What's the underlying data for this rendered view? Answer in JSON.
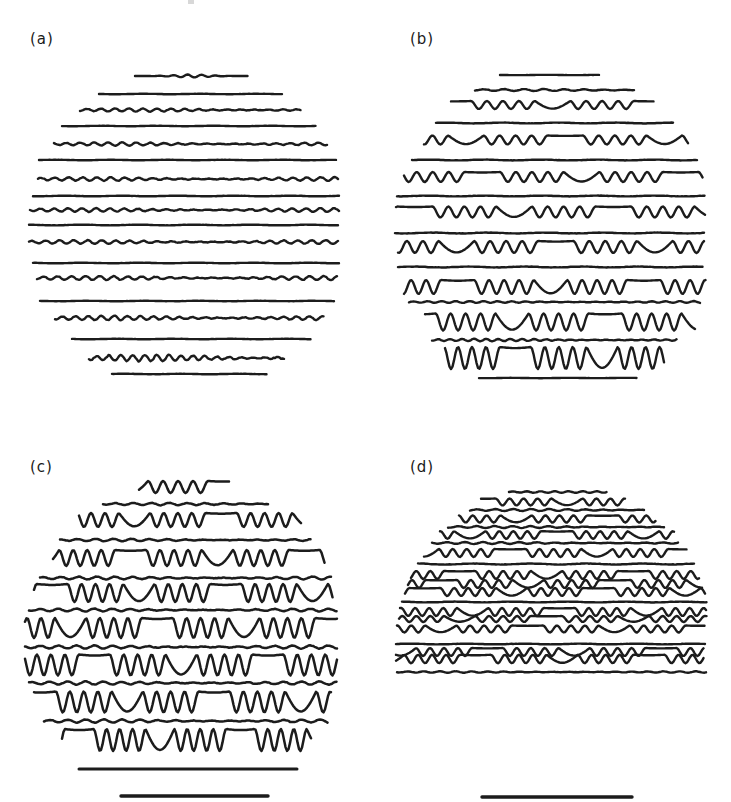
{
  "figure": {
    "ink_color": "#1c1c1c",
    "background": "#ffffff",
    "panels": [
      {
        "id": "a",
        "label": "(a)",
        "label_pos": [
          30,
          30
        ],
        "stroke": 2.4,
        "lines": [
          {
            "y": 76,
            "x1": 135,
            "x2": 248,
            "amp": 1.5,
            "period": 14,
            "pattern": "mid-wave"
          },
          {
            "y": 94,
            "x1": 99,
            "x2": 283,
            "amp": 0.3,
            "period": 20,
            "pattern": "flat"
          },
          {
            "y": 110,
            "x1": 80,
            "x2": 301,
            "amp": 1.6,
            "period": 14,
            "pattern": "wavy"
          },
          {
            "y": 126,
            "x1": 62,
            "x2": 316,
            "amp": 0.3,
            "period": 20,
            "pattern": "flat"
          },
          {
            "y": 144,
            "x1": 54,
            "x2": 328,
            "amp": 1.6,
            "period": 14,
            "pattern": "wavy"
          },
          {
            "y": 160,
            "x1": 39,
            "x2": 336,
            "amp": 0.3,
            "period": 20,
            "pattern": "flat"
          },
          {
            "y": 179,
            "x1": 38,
            "x2": 339,
            "amp": 1.8,
            "period": 14,
            "pattern": "wavy"
          },
          {
            "y": 196,
            "x1": 33,
            "x2": 339,
            "amp": 0.4,
            "period": 20,
            "pattern": "flat"
          },
          {
            "y": 210,
            "x1": 30,
            "x2": 339,
            "amp": 1.8,
            "period": 14,
            "pattern": "wavy"
          },
          {
            "y": 225,
            "x1": 29,
            "x2": 339,
            "amp": 0.5,
            "period": 20,
            "pattern": "flat"
          },
          {
            "y": 242,
            "x1": 29,
            "x2": 339,
            "amp": 1.8,
            "period": 14,
            "pattern": "wavy"
          },
          {
            "y": 263,
            "x1": 33,
            "x2": 339,
            "amp": 0.4,
            "period": 20,
            "pattern": "flat"
          },
          {
            "y": 278,
            "x1": 37,
            "x2": 338,
            "amp": 2.0,
            "period": 14,
            "pattern": "wavy"
          },
          {
            "y": 301,
            "x1": 40,
            "x2": 335,
            "amp": 0.3,
            "period": 20,
            "pattern": "flat"
          },
          {
            "y": 318,
            "x1": 55,
            "x2": 324,
            "amp": 2.2,
            "period": 13,
            "pattern": "wavy"
          },
          {
            "y": 339,
            "x1": 72,
            "x2": 311,
            "amp": 0.3,
            "period": 20,
            "pattern": "flat"
          },
          {
            "y": 358,
            "x1": 89,
            "x2": 285,
            "amp": 3.2,
            "period": 12,
            "pattern": "wavy"
          },
          {
            "y": 374,
            "x1": 112,
            "x2": 267,
            "amp": 0.3,
            "period": 20,
            "pattern": "flat"
          }
        ],
        "scale_bars": []
      },
      {
        "id": "b",
        "label": "(b)",
        "label_pos": [
          410,
          30
        ],
        "stroke": 2.4,
        "lines": [
          {
            "y": 75,
            "x1": 500,
            "x2": 600,
            "amp": 0.2,
            "period": 20,
            "pattern": "flat"
          },
          {
            "y": 90,
            "x1": 475,
            "x2": 635,
            "amp": 1.0,
            "period": 20,
            "pattern": "wavy"
          },
          {
            "y": 105,
            "x1": 451,
            "x2": 654,
            "amp": 4.0,
            "period": 16,
            "pattern": "groups"
          },
          {
            "y": 123,
            "x1": 436,
            "x2": 674,
            "amp": 0.6,
            "period": 20,
            "pattern": "flat"
          },
          {
            "y": 140,
            "x1": 424,
            "x2": 688,
            "amp": 4.5,
            "period": 16,
            "pattern": "groups"
          },
          {
            "y": 160,
            "x1": 412,
            "x2": 698,
            "amp": 0.6,
            "period": 20,
            "pattern": "flat"
          },
          {
            "y": 177,
            "x1": 404,
            "x2": 703,
            "amp": 5.0,
            "period": 16,
            "pattern": "groups"
          },
          {
            "y": 196,
            "x1": 397,
            "x2": 705,
            "amp": 0.6,
            "period": 20,
            "pattern": "flat"
          },
          {
            "y": 212,
            "x1": 396,
            "x2": 705,
            "amp": 5.5,
            "period": 16,
            "pattern": "groups"
          },
          {
            "y": 233,
            "x1": 395,
            "x2": 705,
            "amp": 0.7,
            "period": 20,
            "pattern": "flat"
          },
          {
            "y": 247,
            "x1": 398,
            "x2": 705,
            "amp": 6.0,
            "period": 16,
            "pattern": "groups"
          },
          {
            "y": 267,
            "x1": 398,
            "x2": 703,
            "amp": 0.7,
            "period": 20,
            "pattern": "flat"
          },
          {
            "y": 287,
            "x1": 404,
            "x2": 706,
            "amp": 7.0,
            "period": 15,
            "pattern": "groups"
          },
          {
            "y": 302,
            "x1": 409,
            "x2": 700,
            "amp": 0.9,
            "period": 14,
            "pattern": "wavy"
          },
          {
            "y": 322,
            "x1": 425,
            "x2": 695,
            "amp": 8.5,
            "period": 15,
            "pattern": "groups"
          },
          {
            "y": 340,
            "x1": 432,
            "x2": 677,
            "amp": 1.2,
            "period": 12,
            "pattern": "wavy"
          },
          {
            "y": 358,
            "x1": 445,
            "x2": 665,
            "amp": 11.0,
            "period": 14,
            "pattern": "groups"
          },
          {
            "y": 378,
            "x1": 479,
            "x2": 637,
            "amp": 0.2,
            "period": 20,
            "pattern": "flat"
          }
        ],
        "scale_bars": []
      },
      {
        "id": "c",
        "label": "(c)",
        "label_pos": [
          30,
          458
        ],
        "stroke": 2.5,
        "lines": [
          {
            "y": 487,
            "x1": 139,
            "x2": 229,
            "amp": 6.0,
            "period": 15,
            "pattern": "groups"
          },
          {
            "y": 504,
            "x1": 103,
            "x2": 268,
            "amp": 1.2,
            "period": 18,
            "pattern": "wavy"
          },
          {
            "y": 520,
            "x1": 79,
            "x2": 302,
            "amp": 7.0,
            "period": 14,
            "pattern": "groups"
          },
          {
            "y": 540,
            "x1": 60,
            "x2": 311,
            "amp": 1.2,
            "period": 18,
            "pattern": "wavy"
          },
          {
            "y": 558,
            "x1": 53,
            "x2": 325,
            "amp": 8.0,
            "period": 14,
            "pattern": "groups"
          },
          {
            "y": 578,
            "x1": 40,
            "x2": 331,
            "amp": 1.4,
            "period": 18,
            "pattern": "wavy"
          },
          {
            "y": 593,
            "x1": 34,
            "x2": 333,
            "amp": 9.0,
            "period": 14,
            "pattern": "groups"
          },
          {
            "y": 610,
            "x1": 29,
            "x2": 337,
            "amp": 1.4,
            "period": 18,
            "pattern": "wavy"
          },
          {
            "y": 628,
            "x1": 25,
            "x2": 337,
            "amp": 10.0,
            "period": 14,
            "pattern": "groups"
          },
          {
            "y": 647,
            "x1": 25,
            "x2": 337,
            "amp": 1.6,
            "period": 18,
            "pattern": "wavy"
          },
          {
            "y": 665,
            "x1": 25,
            "x2": 337,
            "amp": 10.5,
            "period": 14,
            "pattern": "groups"
          },
          {
            "y": 683,
            "x1": 29,
            "x2": 337,
            "amp": 1.6,
            "period": 18,
            "pattern": "wavy"
          },
          {
            "y": 702,
            "x1": 34,
            "x2": 332,
            "amp": 10.5,
            "period": 14,
            "pattern": "groups"
          },
          {
            "y": 721,
            "x1": 44,
            "x2": 328,
            "amp": 1.6,
            "period": 18,
            "pattern": "wavy"
          },
          {
            "y": 740,
            "x1": 62,
            "x2": 312,
            "amp": 11.0,
            "period": 13,
            "pattern": "groups"
          }
        ],
        "scale_bars": [
          {
            "y": 769,
            "x1": 79,
            "x2": 297,
            "width": 3.0
          },
          {
            "y": 796,
            "x1": 121,
            "x2": 268,
            "width": 3.4
          }
        ]
      },
      {
        "id": "d",
        "label": "(d)",
        "label_pos": [
          410,
          458
        ],
        "stroke": 2.4,
        "lines": [
          {
            "y": 492,
            "x1": 509,
            "x2": 607,
            "amp": 0.8,
            "period": 14,
            "pattern": "wavy"
          },
          {
            "y": 502,
            "x1": 481,
            "x2": 626,
            "amp": 3.5,
            "period": 14,
            "pattern": "groups"
          },
          {
            "y": 510,
            "x1": 470,
            "x2": 645,
            "amp": 1.0,
            "period": 18,
            "pattern": "wavy"
          },
          {
            "y": 519,
            "x1": 459,
            "x2": 656,
            "amp": 3.6,
            "period": 14,
            "pattern": "groups"
          },
          {
            "y": 527,
            "x1": 448,
            "x2": 665,
            "amp": 1.0,
            "period": 18,
            "pattern": "wavy"
          },
          {
            "y": 535,
            "x1": 440,
            "x2": 674,
            "amp": 3.8,
            "period": 14,
            "pattern": "groups"
          },
          {
            "y": 543,
            "x1": 432,
            "x2": 679,
            "amp": 1.0,
            "period": 18,
            "pattern": "wavy"
          },
          {
            "y": 553,
            "x1": 424,
            "x2": 687,
            "amp": 4.0,
            "period": 14,
            "pattern": "groups"
          },
          {
            "y": 564,
            "x1": 418,
            "x2": 694,
            "amp": 0.8,
            "period": 18,
            "pattern": "flat"
          },
          {
            "y": 575,
            "x1": 411,
            "x2": 699,
            "amp": 4.0,
            "period": 14,
            "pattern": "groups"
          },
          {
            "y": 584,
            "x1": 408,
            "x2": 703,
            "amp": 4.0,
            "period": 14,
            "pattern": "groups"
          },
          {
            "y": 592,
            "x1": 405,
            "x2": 706,
            "amp": 4.0,
            "period": 14,
            "pattern": "groups"
          },
          {
            "y": 602,
            "x1": 402,
            "x2": 707,
            "amp": 0.6,
            "period": 18,
            "pattern": "flat"
          },
          {
            "y": 612,
            "x1": 400,
            "x2": 707,
            "amp": 4.0,
            "period": 14,
            "pattern": "groups"
          },
          {
            "y": 619,
            "x1": 399,
            "x2": 707,
            "amp": 3.0,
            "period": 14,
            "pattern": "groups"
          },
          {
            "y": 629,
            "x1": 397,
            "x2": 705,
            "amp": 3.5,
            "period": 14,
            "pattern": "groups"
          },
          {
            "y": 644,
            "x1": 396,
            "x2": 705,
            "amp": 0.5,
            "period": 18,
            "pattern": "flat"
          },
          {
            "y": 652,
            "x1": 396,
            "x2": 704,
            "amp": 4.0,
            "period": 14,
            "pattern": "groups"
          },
          {
            "y": 659,
            "x1": 396,
            "x2": 704,
            "amp": 4.2,
            "period": 14,
            "pattern": "groups"
          },
          {
            "y": 672,
            "x1": 397,
            "x2": 706,
            "amp": 0.7,
            "period": 16,
            "pattern": "wavy"
          }
        ],
        "scale_bars": [
          {
            "y": 797,
            "x1": 482,
            "x2": 632,
            "width": 3.4
          }
        ]
      }
    ],
    "stray_marks": [
      {
        "x": 188,
        "y": 0,
        "w": 6,
        "h": 4
      }
    ]
  }
}
